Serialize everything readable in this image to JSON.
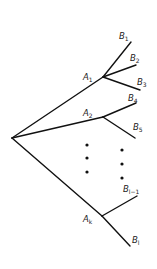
{
  "diagram": {
    "type": "tree",
    "root": {
      "x": 12,
      "y": 138
    },
    "internal_nodes": [
      {
        "id": "A1",
        "label": "A",
        "sub": "1",
        "x": 103,
        "y": 77,
        "lx": 83,
        "ly": 80
      },
      {
        "id": "A2",
        "label": "A",
        "sub": "2",
        "x": 103,
        "y": 117,
        "lx": 83,
        "ly": 116
      },
      {
        "id": "Ak",
        "label": "A",
        "sub": "k",
        "x": 102,
        "y": 216,
        "lx": 83,
        "ly": 222
      }
    ],
    "leaves": [
      {
        "id": "B1",
        "label": "B",
        "sub": "1",
        "parent": "A1",
        "x": 131,
        "y": 42,
        "lx": 119,
        "ly": 39
      },
      {
        "id": "B2",
        "label": "B",
        "sub": "2",
        "parent": "A1",
        "x": 136,
        "y": 65,
        "lx": 130,
        "ly": 61
      },
      {
        "id": "B3",
        "label": "B",
        "sub": "3",
        "parent": "A1",
        "x": 140,
        "y": 90,
        "lx": 137,
        "ly": 85
      },
      {
        "id": "B4",
        "label": "B",
        "sub": "4",
        "parent": "A2",
        "x": 136,
        "y": 103,
        "lx": 128,
        "ly": 101
      },
      {
        "id": "B5",
        "label": "B",
        "sub": "5",
        "parent": "A2",
        "x": 135,
        "y": 138,
        "lx": 133,
        "ly": 130
      },
      {
        "id": "Bl-1",
        "label": "B",
        "sub": "l−1",
        "parent": "Ak",
        "x": 137,
        "y": 196,
        "lx": 123,
        "ly": 192
      },
      {
        "id": "Bl",
        "label": "B",
        "sub": "l",
        "parent": "Ak",
        "x": 130,
        "y": 246,
        "lx": 132,
        "ly": 243
      }
    ],
    "ellipsis_dots": [
      {
        "x": 87,
        "y": 145
      },
      {
        "x": 87,
        "y": 158
      },
      {
        "x": 87,
        "y": 172
      },
      {
        "x": 122,
        "y": 150
      },
      {
        "x": 122,
        "y": 164
      },
      {
        "x": 122,
        "y": 178
      }
    ]
  }
}
